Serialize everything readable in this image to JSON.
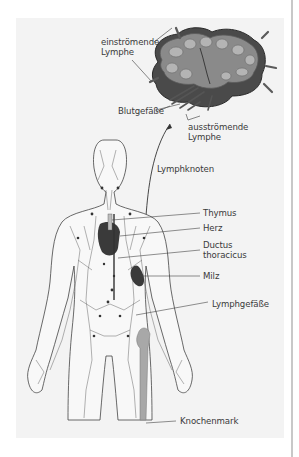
{
  "figure": {
    "labels": {
      "einstroemende_lymphe": [
        "einströmende",
        "Lymphe"
      ],
      "blutgefaesse": "Blutgefäße",
      "ausstroemende_lymphe": [
        "ausströmende",
        "Lymphe"
      ],
      "lymphknoten": "Lymphknoten",
      "thymus": "Thymus",
      "herz": "Herz",
      "ductus_thoracicus": [
        "Ductus",
        "thoracicus"
      ],
      "milz": "Milz",
      "lymphgefaesse": "Lymphgefäße",
      "knochenmark": "Knochenmark"
    },
    "colors": {
      "background": "#f3f3f3",
      "organ_dark": "#3a3a3a",
      "node_mid": "#6e6e6e",
      "bone": "#a8a8a8",
      "outline": "#444444",
      "text": "#3a3a3a"
    }
  }
}
